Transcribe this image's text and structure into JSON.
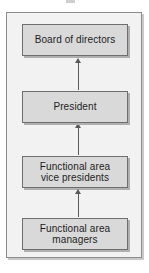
{
  "chart_data": {
    "type": "diagram",
    "diagram_kind": "organizational-hierarchy-chart",
    "title": "",
    "orientation": "vertical-bottom-up",
    "nodes": [
      {
        "id": "board",
        "label": "Board of directors",
        "level": 1
      },
      {
        "id": "president",
        "label": "President",
        "level": 2
      },
      {
        "id": "vps",
        "label": "Functional area\nvice presidents",
        "level": 3
      },
      {
        "id": "managers",
        "label": "Functional area\nmanagers",
        "level": 4
      }
    ],
    "edges": [
      {
        "from": "president",
        "to": "board",
        "style": "arrow-up"
      },
      {
        "from": "vps",
        "to": "president",
        "style": "arrow-up"
      },
      {
        "from": "managers",
        "to": "vps",
        "style": "arrow-up"
      }
    ],
    "colors": {
      "node_fill": "#d9d9d9",
      "node_border": "#6e6e6e",
      "node_shadow": "#b0b0b0",
      "frame_fill": "#f2f2f2",
      "frame_border": "#8c8c8c",
      "arrow": "#5a5a5a",
      "text": "#1d1d1d",
      "page_background": "#ffffff"
    }
  },
  "diagram": {
    "frame_name": "org-chart-frame",
    "nodes": {
      "board": {
        "label": "Board of directors"
      },
      "president": {
        "label": "President"
      },
      "vps": {
        "label": "Functional area\nvice presidents"
      },
      "managers": {
        "label": "Functional area\nmanagers"
      }
    }
  }
}
